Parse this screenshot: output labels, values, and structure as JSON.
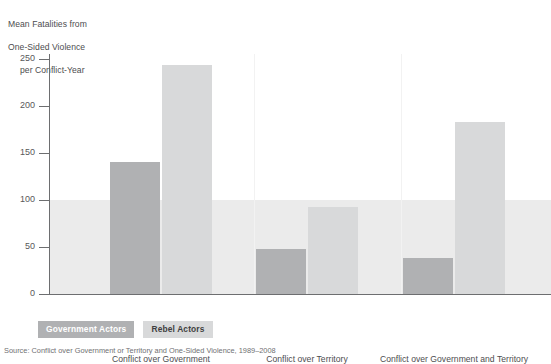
{
  "axis_title": {
    "line1": "Mean Fatalities from",
    "line2": "One-Sided Violence",
    "line3": "per Conflict-Year"
  },
  "legend": {
    "government_label": "Government Actors",
    "rebel_label": "Rebel Actors"
  },
  "caption": {
    "text": "Source: Conflict over Government or Territory and One-Sided Violence, 1989–2008"
  },
  "colors": {
    "government_bar": "#b0b1b3",
    "rebel_bar": "#d8d9da",
    "shaded_band": "#ebebeb",
    "axis": "#6d6e70",
    "text": "#4d4d4f",
    "page_background": "#ffffff"
  },
  "chart_data": {
    "type": "bar",
    "title": "",
    "subtitle": "",
    "xlabel": "",
    "ylabel": "Mean Fatalities from One-Sided Violence per Conflict-Year",
    "ylim": [
      0,
      255
    ],
    "yticks": [
      0,
      50,
      100,
      150,
      200,
      250
    ],
    "ytick_labels": [
      "0",
      "50",
      "100",
      "150",
      "200",
      "250"
    ],
    "grid": false,
    "legend_position": "below-plot-left",
    "categories": [
      "Conflict over Government",
      "Conflict over Territory",
      "Conflict over Government and Territory"
    ],
    "series": [
      {
        "name": "Government Actors",
        "color": "#b0b1b3",
        "values": [
          140,
          48,
          38
        ]
      },
      {
        "name": "Rebel Actors",
        "color": "#d8d9da",
        "values": [
          243,
          92,
          183
        ]
      }
    ],
    "annotations": [
      {
        "type": "shaded-band",
        "y_from": 0,
        "y_to": 100,
        "color": "#ebebeb"
      }
    ]
  }
}
